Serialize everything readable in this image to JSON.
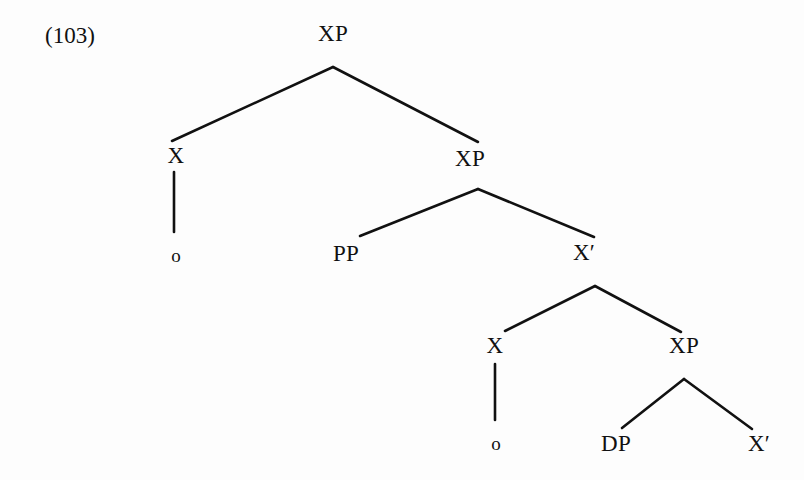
{
  "figure": {
    "example_number": "(103)",
    "kind": "syntax-tree",
    "background_color": "#fdfdfd",
    "ink_color": "#111111"
  },
  "tree": {
    "nodes": [
      {
        "id": "xp-top",
        "label": "XP",
        "x": 333,
        "y": 33,
        "type": "nonterminal"
      },
      {
        "id": "x-left",
        "label": "X",
        "x": 176,
        "y": 155,
        "type": "nonterminal"
      },
      {
        "id": "o-left",
        "label": "o",
        "x": 176,
        "y": 255,
        "type": "terminal"
      },
      {
        "id": "xp-mid",
        "label": "XP",
        "x": 470,
        "y": 158,
        "type": "nonterminal"
      },
      {
        "id": "pp-mid",
        "label": "PP",
        "x": 346,
        "y": 253,
        "type": "nonterminal"
      },
      {
        "id": "xbar-mid",
        "label": "X′",
        "x": 584,
        "y": 252,
        "type": "nonterminal"
      },
      {
        "id": "x-lower",
        "label": "X",
        "x": 495,
        "y": 345,
        "type": "nonterminal"
      },
      {
        "id": "o-lower",
        "label": "o",
        "x": 496,
        "y": 443,
        "type": "terminal"
      },
      {
        "id": "xp-lower",
        "label": "XP",
        "x": 684,
        "y": 345,
        "type": "nonterminal"
      },
      {
        "id": "dp-bottom",
        "label": "DP",
        "x": 616,
        "y": 443,
        "type": "nonterminal"
      },
      {
        "id": "xbar-bottom",
        "label": "X′",
        "x": 759,
        "y": 443,
        "type": "nonterminal"
      }
    ],
    "branches": [
      {
        "from": "xp-top",
        "to": "x-left",
        "x1": 333,
        "y1": 67,
        "x2": 172,
        "y2": 141
      },
      {
        "from": "xp-top",
        "to": "xp-mid",
        "x1": 333,
        "y1": 67,
        "x2": 478,
        "y2": 142
      },
      {
        "from": "x-left",
        "to": "o-left",
        "x1": 174,
        "y1": 172,
        "x2": 174,
        "y2": 232
      },
      {
        "from": "xp-mid",
        "to": "pp-mid",
        "x1": 478,
        "y1": 189,
        "x2": 360,
        "y2": 236
      },
      {
        "from": "xp-mid",
        "to": "xbar-mid",
        "x1": 478,
        "y1": 189,
        "x2": 594,
        "y2": 237
      },
      {
        "from": "xbar-mid",
        "to": "x-lower",
        "x1": 595,
        "y1": 286,
        "x2": 505,
        "y2": 331
      },
      {
        "from": "xbar-mid",
        "to": "xp-lower",
        "x1": 595,
        "y1": 286,
        "x2": 681,
        "y2": 332
      },
      {
        "from": "x-lower",
        "to": "o-lower",
        "x1": 495,
        "y1": 364,
        "x2": 495,
        "y2": 420
      },
      {
        "from": "xp-lower",
        "to": "dp-bottom",
        "x1": 684,
        "y1": 379,
        "x2": 622,
        "y2": 428
      },
      {
        "from": "xp-lower",
        "to": "xbar-bottom",
        "x1": 684,
        "y1": 379,
        "x2": 752,
        "y2": 429
      }
    ]
  },
  "example_label": {
    "x": 45,
    "y": 24
  }
}
